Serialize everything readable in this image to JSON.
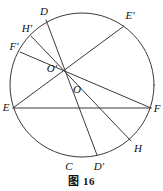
{
  "figure": {
    "caption": "图 16",
    "stroke_color": "#3a3a3a",
    "background_color": "#ffffff",
    "circle": {
      "cx": 82,
      "cy": 85,
      "r": 72
    },
    "concurrency_point": {
      "x": 62,
      "y": 66,
      "label": "O'"
    },
    "center_point": {
      "x": 75,
      "y": 92,
      "label": "O"
    },
    "labels": {
      "D": "D",
      "E_prime": "E'",
      "H_prime": "H'",
      "F_prime": "F'",
      "E": "E",
      "F": "F",
      "H": "H",
      "C": "C",
      "D_prime": "D'",
      "O_prime": "O'",
      "O": "O"
    },
    "label_positions": {
      "D": {
        "x": 44,
        "y": 11
      },
      "E_prime": {
        "x": 130,
        "y": 15
      },
      "H_prime": {
        "x": 27,
        "y": 28
      },
      "F_prime": {
        "x": 14,
        "y": 46
      },
      "E": {
        "x": 6,
        "y": 107
      },
      "F": {
        "x": 157,
        "y": 108
      },
      "H": {
        "x": 138,
        "y": 148
      },
      "C": {
        "x": 69,
        "y": 166
      },
      "D_prime": {
        "x": 99,
        "y": 166
      },
      "O_prime": {
        "x": 52,
        "y": 68
      },
      "O": {
        "x": 77,
        "y": 89
      }
    },
    "circle_points": {
      "D": {
        "x": 46,
        "y": 20
      },
      "E_prime": {
        "x": 124,
        "y": 26
      },
      "H_prime": {
        "x": 31,
        "y": 36
      },
      "F_prime": {
        "x": 20,
        "y": 52
      },
      "E": {
        "x": 13,
        "y": 108
      },
      "F": {
        "x": 151,
        "y": 108
      },
      "H": {
        "x": 131,
        "y": 141
      },
      "C": {
        "x": 71,
        "y": 157
      },
      "D_prime": {
        "x": 97,
        "y": 155
      }
    },
    "chords": [
      {
        "name": "chord-E-F",
        "from": "E",
        "to": "F"
      },
      {
        "name": "chord-D-D-prime",
        "from": "D",
        "to": "D_prime"
      },
      {
        "name": "chord-E-E-prime",
        "from": "E",
        "to": "E_prime"
      },
      {
        "name": "chord-F-F-prime",
        "from": "F",
        "to": "F_prime"
      },
      {
        "name": "chord-H-H-prime",
        "from": "H",
        "to": "H_prime"
      }
    ]
  }
}
